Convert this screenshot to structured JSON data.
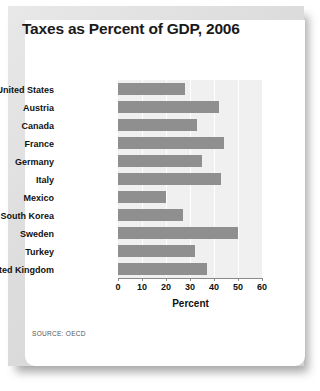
{
  "chart_data": {
    "type": "bar",
    "orientation": "horizontal",
    "title": "Taxes as Percent of GDP, 2006",
    "xlabel": "Percent",
    "ylabel": "Selected countries",
    "xlim": [
      0,
      60
    ],
    "xticks": [
      0,
      10,
      20,
      30,
      40,
      50,
      60
    ],
    "xtick_labels": [
      "0",
      "10",
      "20",
      "30",
      "40",
      "50",
      "60"
    ],
    "grid": true,
    "legend": null,
    "bar_color": "#8f8f8f",
    "plot_background": "#f0f0f0",
    "categories": [
      "United States",
      "Austria",
      "Canada",
      "France",
      "Germany",
      "Italy",
      "Mexico",
      "South Korea",
      "Sweden",
      "Turkey",
      "United Kingdom"
    ],
    "values": [
      28,
      42,
      33,
      44,
      35,
      43,
      20,
      27,
      50,
      32,
      37
    ],
    "source": "SOURCE: OECD"
  },
  "figure": {
    "title": "Taxes as Percent of GDP, 2006",
    "source_note": "SOURCE: OECD",
    "frame_color": "#dcdcdc",
    "card_color": "#ffffff"
  }
}
